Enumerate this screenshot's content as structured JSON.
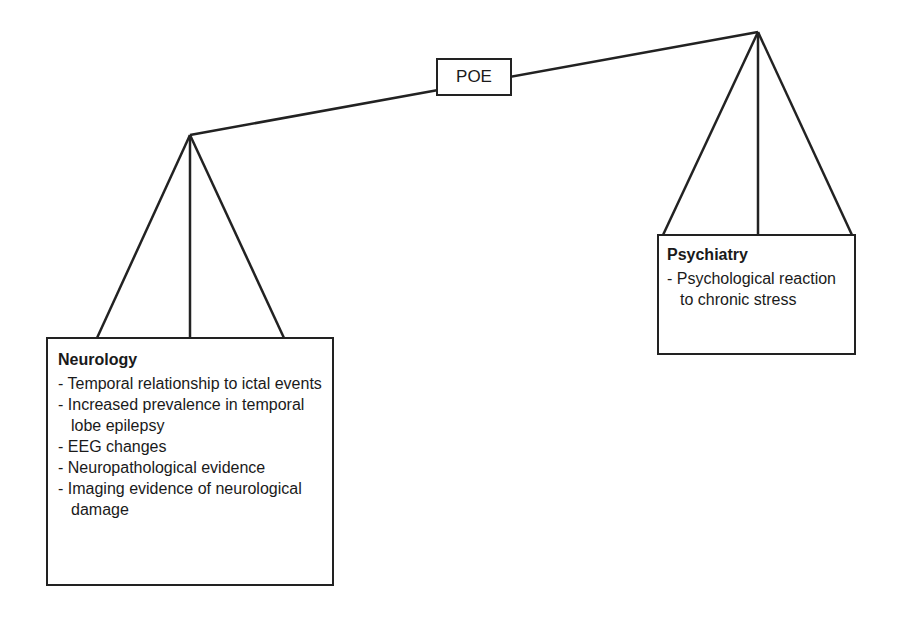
{
  "fulcrum": {
    "label": "POE"
  },
  "left_pan": {
    "title": "Neurology",
    "items": [
      "Temporal relationship to ictal events",
      "Increased prevalence in temporal lobe epilepsy",
      "EEG changes",
      "Neuropathological evidence",
      "Imaging evidence of neurological damage"
    ]
  },
  "right_pan": {
    "title": "Psychiatry",
    "items": [
      "Psychological reaction to chronic stress"
    ]
  },
  "colors": {
    "stroke": "#222222",
    "background": "#ffffff",
    "text": "#1a1a1a"
  }
}
